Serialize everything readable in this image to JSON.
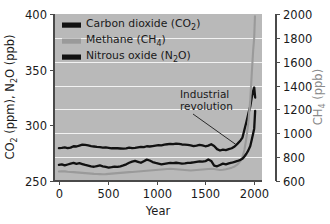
{
  "chart_data": {
    "type": "line",
    "title": "",
    "xlabel": "Year",
    "ylabel_left": "CO2 (ppm), N2O (ppb)",
    "ylabel_right": "CH4 (ppb)",
    "xlim": [
      -50,
      2080
    ],
    "ylim_left": [
      250,
      400
    ],
    "ylim_right": [
      600,
      2000
    ],
    "xticks": [
      0,
      500,
      1000,
      1500,
      2000
    ],
    "xticklabels": [
      "0",
      "500",
      "1000",
      "1500",
      "2000"
    ],
    "yticks_left": [
      250,
      300,
      350,
      400
    ],
    "yticklabels_left": [
      "250",
      "300",
      "350",
      "400"
    ],
    "yticks_right": [
      600,
      800,
      1000,
      1200,
      1400,
      1600,
      1800,
      2000
    ],
    "yticklabels_right": [
      "600",
      "800",
      "1000",
      "1200",
      "1400",
      "1600",
      "1800",
      "2000"
    ],
    "grid": "horizontal-white-on-gray",
    "plot_background": "#b9b9b9",
    "legend_position": "upper-left-inside",
    "annotations": [
      {
        "text_line1": "Industrial",
        "text_line2": "revolution",
        "x": 1560,
        "y": 318,
        "pointer_to_x": 1810,
        "pointer_to_y": 283
      }
    ],
    "series": [
      {
        "name": "Carbon dioxide (CO2)",
        "label_plain": "Carbon dioxide (CO",
        "label_sub": "2",
        "label_tail": ")",
        "color": "#111111",
        "axis": "left",
        "unit": "ppm",
        "x": [
          0,
          30,
          60,
          90,
          120,
          150,
          180,
          210,
          240,
          270,
          300,
          330,
          360,
          390,
          420,
          450,
          480,
          510,
          540,
          570,
          600,
          630,
          660,
          690,
          720,
          750,
          780,
          810,
          840,
          870,
          900,
          930,
          960,
          990,
          1020,
          1050,
          1080,
          1110,
          1140,
          1170,
          1200,
          1230,
          1260,
          1290,
          1320,
          1350,
          1380,
          1410,
          1440,
          1470,
          1500,
          1530,
          1560,
          1590,
          1620,
          1650,
          1680,
          1710,
          1740,
          1770,
          1800,
          1830,
          1860,
          1880,
          1900,
          1920,
          1940,
          1960,
          1975,
          1990,
          2000,
          2010
        ],
        "y": [
          279.5,
          279.8,
          280.2,
          279.6,
          280.0,
          281.2,
          281.0,
          281.8,
          282.6,
          282.4,
          282.0,
          281.4,
          281.0,
          280.6,
          280.4,
          280.0,
          280.2,
          279.8,
          279.4,
          279.6,
          279.4,
          279.2,
          279.0,
          279.4,
          280.0,
          279.6,
          279.8,
          280.2,
          280.6,
          280.4,
          281.2,
          281.0,
          281.4,
          281.8,
          282.2,
          282.0,
          282.6,
          283.0,
          283.4,
          283.2,
          283.6,
          283.4,
          282.8,
          282.6,
          282.4,
          282.0,
          281.4,
          281.8,
          282.4,
          282.0,
          281.2,
          281.8,
          283.0,
          281.4,
          278.6,
          277.4,
          278.2,
          277.8,
          278.6,
          279.4,
          281.0,
          283.6,
          286.4,
          289.0,
          296.0,
          303.0,
          310.5,
          317.0,
          325.0,
          331.0,
          334.0,
          325.0
        ]
      },
      {
        "name": "Methane (CH4)",
        "label_plain": "Methane (CH",
        "label_sub": "4",
        "label_tail": ")",
        "color": "#9a9a9a",
        "axis": "right",
        "unit": "ppb",
        "x": [
          0,
          30,
          60,
          90,
          120,
          150,
          180,
          210,
          240,
          270,
          300,
          330,
          360,
          390,
          420,
          450,
          480,
          510,
          540,
          570,
          600,
          630,
          660,
          690,
          720,
          750,
          780,
          810,
          840,
          870,
          900,
          930,
          960,
          990,
          1020,
          1050,
          1080,
          1110,
          1140,
          1170,
          1200,
          1230,
          1260,
          1290,
          1320,
          1350,
          1380,
          1410,
          1440,
          1470,
          1500,
          1530,
          1560,
          1590,
          1620,
          1650,
          1680,
          1710,
          1740,
          1770,
          1800,
          1830,
          1860,
          1880,
          1900,
          1920,
          1940,
          1960,
          1975,
          1990,
          2000,
          2008
        ],
        "y": [
          680,
          682,
          681,
          678,
          676,
          674,
          672,
          670,
          668,
          666,
          664,
          662,
          660,
          659,
          658,
          657,
          658,
          660,
          662,
          664,
          666,
          668,
          670,
          672,
          674,
          676,
          678,
          680,
          682,
          684,
          686,
          688,
          690,
          692,
          694,
          696,
          698,
          700,
          702,
          700,
          698,
          696,
          694,
          692,
          690,
          688,
          690,
          692,
          694,
          696,
          698,
          700,
          702,
          700,
          696,
          692,
          694,
          698,
          704,
          712,
          722,
          740,
          768,
          800,
          860,
          960,
          1090,
          1280,
          1500,
          1700,
          1800,
          1980
        ]
      },
      {
        "name": "Nitrous oxide (N2O)",
        "label_plain": "Nitrous oxide (N",
        "label_sub": "2",
        "label_tail": "O)",
        "color": "#111111",
        "axis": "left",
        "unit": "ppb",
        "x": [
          0,
          30,
          60,
          90,
          120,
          150,
          180,
          210,
          240,
          270,
          300,
          330,
          360,
          390,
          420,
          450,
          480,
          510,
          540,
          570,
          600,
          630,
          660,
          690,
          720,
          750,
          780,
          810,
          840,
          870,
          900,
          930,
          960,
          990,
          1020,
          1050,
          1080,
          1110,
          1140,
          1170,
          1200,
          1230,
          1260,
          1290,
          1320,
          1350,
          1380,
          1410,
          1440,
          1470,
          1500,
          1530,
          1560,
          1590,
          1620,
          1650,
          1680,
          1710,
          1740,
          1770,
          1800,
          1830,
          1860,
          1880,
          1900,
          1920,
          1940,
          1960,
          1975,
          1990,
          2000,
          2010
        ],
        "y": [
          264.5,
          265.0,
          264.0,
          264.8,
          265.6,
          266.2,
          265.4,
          266.0,
          265.2,
          264.4,
          263.8,
          263.2,
          262.8,
          263.4,
          264.0,
          263.2,
          262.6,
          262.0,
          262.4,
          263.0,
          262.6,
          263.2,
          264.0,
          265.0,
          266.4,
          267.4,
          268.0,
          267.2,
          266.4,
          267.8,
          269.2,
          268.4,
          267.0,
          266.2,
          265.6,
          265.0,
          265.4,
          265.8,
          266.2,
          266.0,
          266.4,
          266.0,
          265.6,
          265.8,
          266.2,
          266.4,
          266.8,
          267.2,
          267.6,
          267.4,
          267.8,
          269.4,
          268.0,
          263.8,
          263.2,
          264.4,
          265.6,
          265.0,
          265.8,
          266.4,
          267.2,
          268.0,
          269.0,
          270.0,
          272.0,
          274.5,
          277.5,
          281.5,
          287.0,
          293.0,
          297.0,
          313.0
        ]
      }
    ]
  },
  "legend": {
    "items": [
      {
        "label": "Carbon dioxide (CO2)",
        "color": "#111111"
      },
      {
        "label": "Methane (CH4)",
        "color": "#9a9a9a"
      },
      {
        "label": "Nitrous oxide (N2O)",
        "color": "#111111"
      }
    ]
  }
}
